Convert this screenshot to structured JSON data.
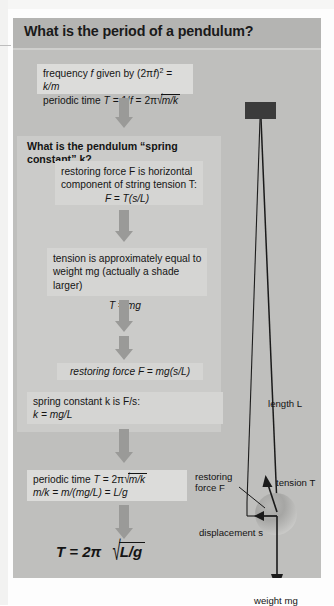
{
  "figure": {
    "title": "What is the period of a pendulum?",
    "subheading": "What is the pendulum “spring constant” k?"
  },
  "flow": {
    "step1": {
      "line1_a": "frequency ",
      "line1_f": "f",
      "line1_b": " given by (2π",
      "line1_f2": "f",
      "line1_c": ")",
      "line1_sup": "2",
      "line1_d": " = ",
      "line1_e": "k/m",
      "line2_a": "periodic time ",
      "line2_T": "T",
      "line2_b": " = 1/",
      "line2_f": "f",
      "line2_c": " = 2π",
      "line2_radicand": "m/k"
    },
    "step2": {
      "line1": "restoring force F is horizontal",
      "line2": "component of string tension T:",
      "line3": "F = T(s/L)"
    },
    "step3": {
      "line1": "tension is approximately equal to",
      "line2": "weight mg (actually a shade larger)",
      "line3": "T = mg"
    },
    "step4": {
      "line1": "restoring force F = mg(s/L)"
    },
    "step5": {
      "line1": "spring constant k is F/s:",
      "line2": "k = mg/L"
    },
    "step6": {
      "line1_a": "periodic time ",
      "line1_T": "T",
      "line1_b": " = 2π",
      "line1_radicand": "m/k",
      "line2": "m/k = m/(mg/L) = L/g"
    },
    "result": {
      "lead": "T = 2π",
      "radicand": "L/g"
    }
  },
  "diagram": {
    "label_length": "length L",
    "label_tension": "tension T",
    "label_restoring_1": "restoring",
    "label_restoring_2": "force F",
    "label_displacement": "displacement s",
    "label_weight": "weight mg"
  },
  "colors": {
    "panel_grey": "#bfbfbd",
    "inner_grey": "#cbcbc9",
    "box_grey": "#d5d5d3",
    "arrow_grey": "#9a9a98",
    "ink": "#141414",
    "pivot_dark": "#3b3b3b"
  }
}
